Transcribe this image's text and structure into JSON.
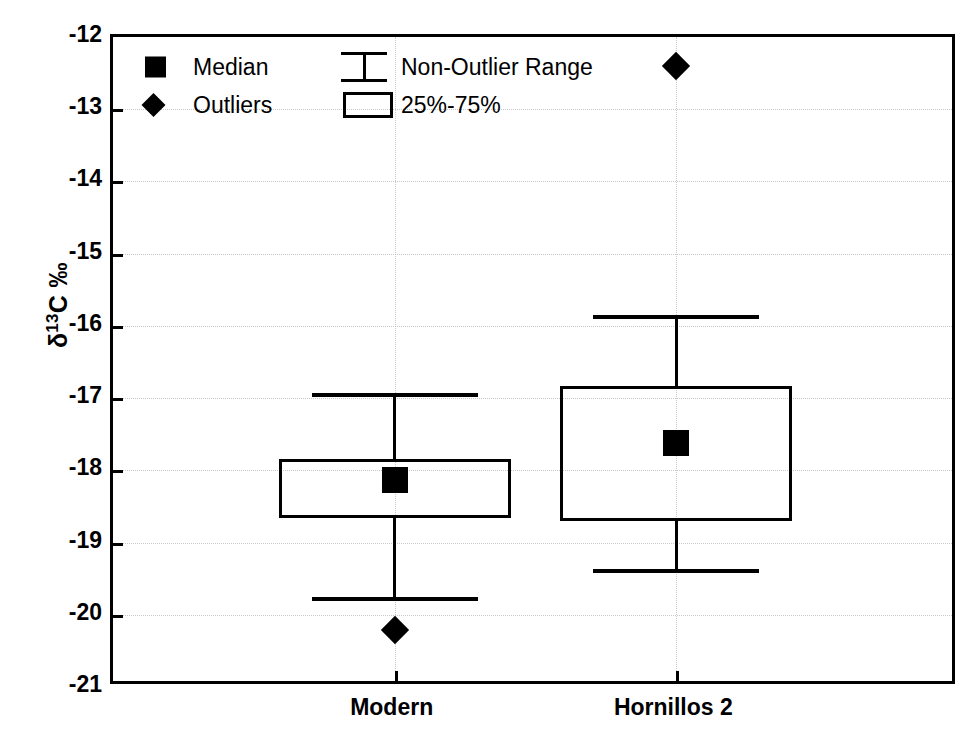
{
  "chart_data": {
    "type": "box",
    "title": "",
    "xlabel": "",
    "ylabel": "δ13C ‰",
    "ylabel_parts": {
      "delta": "δ",
      "superscript": "13",
      "element": "C ‰"
    },
    "categories": [
      "Modern",
      "Hornillos 2"
    ],
    "ylim": [
      -21,
      -12
    ],
    "y_ticks": [
      -12,
      -13,
      -14,
      -15,
      -16,
      -17,
      -18,
      -19,
      -20,
      -21
    ],
    "y_tick_labels": [
      "-12",
      "-13",
      "-14",
      "-15",
      "-16",
      "-17",
      "-18",
      "-19",
      "-20",
      "-21"
    ],
    "grid": true,
    "grid_style": "dotted",
    "legend_position": "top-left",
    "boxes": [
      {
        "category": "Modern",
        "whisker_low": -19.75,
        "q1": -18.66,
        "median": -18.13,
        "q3": -17.84,
        "whisker_high": -16.93,
        "outliers": [
          -20.21
        ]
      },
      {
        "category": "Hornillos 2",
        "whisker_low": -19.37,
        "q1": -18.7,
        "median": -17.62,
        "q3": -16.83,
        "whisker_high": -15.85,
        "outliers": [
          -12.4
        ]
      }
    ],
    "legend": [
      {
        "key": "median",
        "label": "Median",
        "marker": "filled-square-icon"
      },
      {
        "key": "outliers",
        "label": "Outliers",
        "marker": "filled-diamond-icon"
      },
      {
        "key": "non_outlier_range",
        "label": "Non-Outlier Range",
        "marker": "i-beam-whisker-icon"
      },
      {
        "key": "iqr",
        "label": "25%-75%",
        "marker": "open-rectangle-icon"
      }
    ],
    "colors": {
      "line": "#000000",
      "marker": "#000000",
      "background": "#ffffff",
      "grid": "#c9c9c9"
    }
  }
}
